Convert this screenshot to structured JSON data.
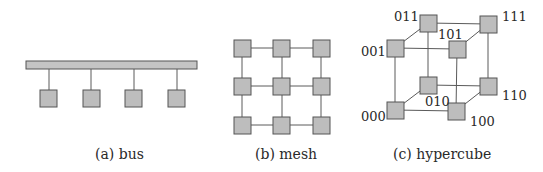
{
  "figure": {
    "panels": [
      {
        "id": "bus",
        "caption": "(a) bus",
        "node_count": 4
      },
      {
        "id": "mesh",
        "caption": "(b) mesh",
        "rows": 3,
        "cols": 3
      },
      {
        "id": "hypercube",
        "caption": "(c) hypercube",
        "node_labels": {
          "n000": "000",
          "n001": "001",
          "n010": "010",
          "n011": "011",
          "n100": "100",
          "n101": "101",
          "n110": "110",
          "n111": "111"
        }
      }
    ],
    "colors": {
      "node_fill": "#bdbdbd",
      "node_stroke": "#555555",
      "link": "#5a5a5a",
      "text": "#2a2a2a"
    }
  }
}
